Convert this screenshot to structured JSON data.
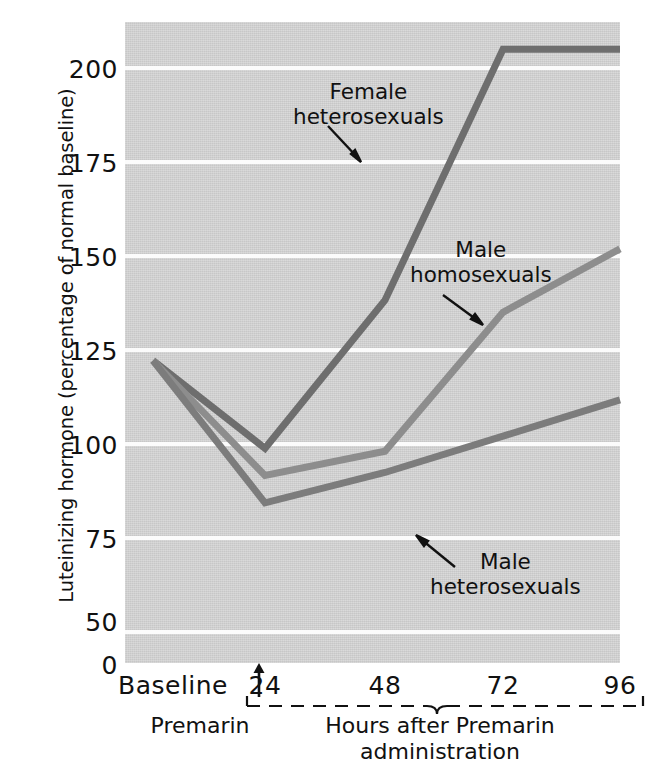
{
  "chart_data": {
    "type": "line",
    "title": "",
    "xlabel": "Hours after Premarin administration",
    "ylabel": "Luteinizing hormone (percentage of normal baseline)",
    "x": [
      "Baseline",
      "24",
      "48",
      "72",
      "96"
    ],
    "x_numeric": [
      0,
      24,
      48,
      72,
      96
    ],
    "xtick_labels": [
      "Baseline",
      "24",
      "48",
      "72",
      "96"
    ],
    "ytick_labels": [
      "200",
      "175",
      "150",
      "125",
      "100",
      "75",
      "50",
      "0"
    ],
    "ytick_values": [
      200,
      175,
      150,
      125,
      100,
      75,
      50,
      0
    ],
    "ylim": [
      0,
      212
    ],
    "grid": true,
    "legend_position": "inline-annotations",
    "series": [
      {
        "name": "Female heterosexuals",
        "color": "#6e6e6e",
        "values": [
          100,
          71,
          120,
          203,
          203
        ]
      },
      {
        "name": "Male homosexuals",
        "color": "#8d8d8d",
        "values": [
          100,
          62,
          70,
          116,
          137
        ]
      },
      {
        "name": "Male heterosexuals",
        "color": "#7c7c7c",
        "values": [
          100,
          53,
          63,
          75,
          87
        ]
      }
    ],
    "annotations": [
      {
        "name": "Female heterosexuals",
        "text": "Female\nheterosexuals"
      },
      {
        "name": "Male homosexuals",
        "text": "Male\nhomosexuals"
      },
      {
        "name": "Male heterosexuals",
        "text": "Male\nheterosexuals"
      }
    ],
    "axis_notes": {
      "premarin_marker": "Premarin",
      "bracket_caption": "Hours after Premarin\nadministration"
    },
    "colors": {
      "plot_background": "#d2d2d2",
      "gridline": "#fbfbfb",
      "text": "#111111",
      "page_background": "#ffffff"
    }
  },
  "axis": {
    "y_title": "Luteinizing hormone (percentage of normal baseline)",
    "y_ticks": [
      "200",
      "175",
      "150",
      "125",
      "100",
      "75",
      "50",
      "0"
    ],
    "x_tick_baseline": "Baseline",
    "x_tick_24": "24",
    "x_tick_48": "48",
    "x_tick_72": "72",
    "x_tick_96": "96"
  },
  "annotations": {
    "female_heterosexuals": "Female\nheterosexuals",
    "male_homosexuals": "Male\nhomosexuals",
    "male_heterosexuals": "Male\nheterosexuals",
    "premarin": "Premarin",
    "hours_caption": "Hours after Premarin\nadministration"
  }
}
